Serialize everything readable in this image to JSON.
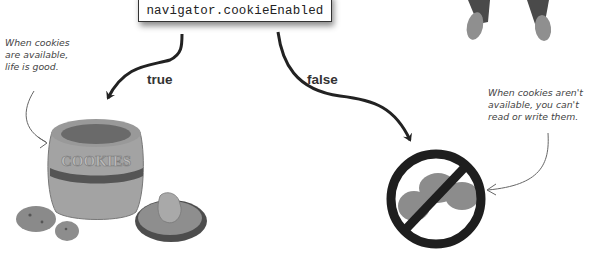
{
  "code_box": {
    "expression": "navigator.cookieEnabled"
  },
  "branches": {
    "true_label": "true",
    "false_label": "false"
  },
  "notes": {
    "left": [
      "When cookies",
      "are available,",
      "life is good."
    ],
    "right": [
      "When cookies aren't",
      "available, you can't",
      "read or write them."
    ]
  },
  "illustrations": {
    "cookie_jar_text": "COOKIES",
    "true_outcome": "cookie-jar-with-cookies",
    "false_outcome": "no-cookies-prohibition-sign",
    "top_right": "person-legs-and-shoes"
  },
  "colors": {
    "ink": "#222222",
    "jar": "#9a9a9a",
    "band": "#555555",
    "sign": "#1e1e1e"
  }
}
